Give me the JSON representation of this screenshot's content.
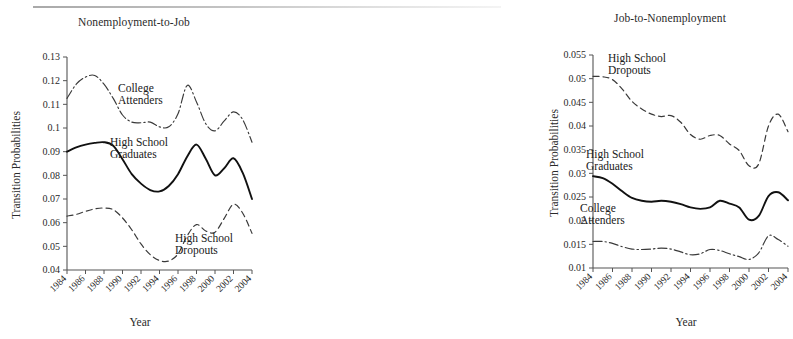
{
  "figure": {
    "background": "#ffffff",
    "ink_color": "#111111"
  },
  "panels": [
    {
      "id": "nonemployment-to-job",
      "title": "Nonemployment-to-Job",
      "ylabel": "Transition Probabilities",
      "xlabel": "Year",
      "annotations": [
        {
          "name": "college-attenders-label",
          "text": "College\nAttenders",
          "x": 118,
          "y": 82
        },
        {
          "name": "high-school-graduates-label",
          "text": "High School\nGraduates",
          "x": 110,
          "y": 136
        },
        {
          "name": "high-school-dropouts-label",
          "text": "High School\nDropouts",
          "x": 175,
          "y": 232
        }
      ]
    },
    {
      "id": "job-to-nonemployment",
      "title": "Job-to-Nonemployment",
      "ylabel": "Transition Probabilities",
      "xlabel": "Year",
      "annotations": [
        {
          "name": "high-school-dropouts-label",
          "text": "High School\nDropouts",
          "x": 72,
          "y": 52
        },
        {
          "name": "high-school-graduates-label",
          "text": "High School\nGraduates",
          "x": 50,
          "y": 148
        },
        {
          "name": "college-attenders-label",
          "text": "College\nAttenders",
          "x": 44,
          "y": 202
        }
      ]
    }
  ],
  "chart_data": [
    {
      "type": "line",
      "panel": "left",
      "title": "Nonemployment-to-Job",
      "xlabel": "Year",
      "ylabel": "Transition Probabilities",
      "xlim": [
        1984,
        2004
      ],
      "ylim": [
        0.04,
        0.13
      ],
      "ytick_labels": [
        "0.13",
        "0.12",
        "0.11",
        "0.1",
        "0.09",
        "0.08",
        "0.07",
        "0.06",
        "0.05",
        "0.04"
      ],
      "yticks": [
        0.13,
        0.12,
        0.11,
        0.1,
        0.09,
        0.08,
        0.07,
        0.06,
        0.05,
        0.04
      ],
      "xticks": [
        1984,
        1986,
        1988,
        1990,
        1992,
        1994,
        1996,
        1998,
        2000,
        2002,
        2004
      ],
      "xtick_labels": [
        "1984",
        "1986",
        "1988",
        "1990",
        "1992",
        "1994",
        "1996",
        "1998",
        "2000",
        "2002",
        "2004"
      ],
      "grid": false,
      "legend": "inline-annotations",
      "x": [
        1984,
        1985,
        1986,
        1987,
        1988,
        1989,
        1990,
        1991,
        1992,
        1993,
        1994,
        1995,
        1996,
        1997,
        1998,
        1999,
        2000,
        2001,
        2002,
        2003,
        2004
      ],
      "series": [
        {
          "name": "College Attenders",
          "style": "dash-dot",
          "values": [
            0.1125,
            0.1185,
            0.1215,
            0.1222,
            0.1185,
            0.1125,
            0.1055,
            0.1025,
            0.1022,
            0.1025,
            0.1005,
            0.1005,
            0.106,
            0.118,
            0.111,
            0.1018,
            0.0988,
            0.103,
            0.1068,
            0.1035,
            0.094
          ]
        },
        {
          "name": "High School Graduates",
          "style": "solid",
          "values": [
            0.09,
            0.0918,
            0.093,
            0.0937,
            0.094,
            0.0925,
            0.0868,
            0.0805,
            0.0765,
            0.0738,
            0.0732,
            0.0755,
            0.0805,
            0.088,
            0.093,
            0.087,
            0.08,
            0.083,
            0.0872,
            0.081,
            0.07
          ]
        },
        {
          "name": "High School Dropouts",
          "style": "dashed",
          "values": [
            0.0628,
            0.0635,
            0.0648,
            0.0658,
            0.0662,
            0.0655,
            0.062,
            0.057,
            0.051,
            0.0465,
            0.044,
            0.0438,
            0.0468,
            0.0545,
            0.0592,
            0.0565,
            0.056,
            0.0618,
            0.0678,
            0.064,
            0.0555
          ]
        }
      ]
    },
    {
      "type": "line",
      "panel": "right",
      "title": "Job-to-Nonemployment",
      "xlabel": "Year",
      "ylabel": "Transition Probabilities",
      "xlim": [
        1984,
        2004
      ],
      "ylim": [
        0.01,
        0.055
      ],
      "ytick_labels": [
        "0.055",
        "0.05",
        "0.045",
        "0.04",
        "0.035",
        "0.03",
        "0.025",
        "0.02",
        "0.015",
        "0.01"
      ],
      "yticks": [
        0.055,
        0.05,
        0.045,
        0.04,
        0.035,
        0.03,
        0.025,
        0.02,
        0.015,
        0.01
      ],
      "xticks": [
        1984,
        1986,
        1988,
        1990,
        1992,
        1994,
        1996,
        1998,
        2000,
        2002,
        2004
      ],
      "xtick_labels": [
        "1984",
        "1986",
        "1988",
        "1990",
        "1992",
        "1994",
        "1996",
        "1998",
        "2000",
        "2002",
        "2004"
      ],
      "grid": false,
      "legend": "inline-annotations",
      "x": [
        1984,
        1985,
        1986,
        1987,
        1988,
        1989,
        1990,
        1991,
        1992,
        1993,
        1994,
        1995,
        1996,
        1997,
        1998,
        1999,
        2000,
        2001,
        2002,
        2003,
        2004
      ],
      "series": [
        {
          "name": "High School Dropouts",
          "style": "dashed",
          "values": [
            0.0505,
            0.0504,
            0.0498,
            0.0478,
            0.0452,
            0.0436,
            0.0425,
            0.042,
            0.0422,
            0.0408,
            0.0382,
            0.0372,
            0.038,
            0.038,
            0.0362,
            0.0348,
            0.0316,
            0.032,
            0.04,
            0.0425,
            0.0388
          ]
        },
        {
          "name": "High School Graduates",
          "style": "solid",
          "values": [
            0.0294,
            0.029,
            0.0278,
            0.0262,
            0.0248,
            0.0242,
            0.024,
            0.0242,
            0.024,
            0.0235,
            0.0228,
            0.0225,
            0.0228,
            0.0242,
            0.0236,
            0.0228,
            0.0202,
            0.021,
            0.0252,
            0.026,
            0.0243
          ]
        },
        {
          "name": "College Attenders",
          "style": "dash-dot",
          "values": [
            0.0156,
            0.0156,
            0.0152,
            0.0145,
            0.014,
            0.0139,
            0.014,
            0.0142,
            0.014,
            0.0134,
            0.0128,
            0.013,
            0.0139,
            0.0137,
            0.013,
            0.0124,
            0.0118,
            0.0132,
            0.0168,
            0.016,
            0.0146
          ]
        }
      ]
    }
  ]
}
